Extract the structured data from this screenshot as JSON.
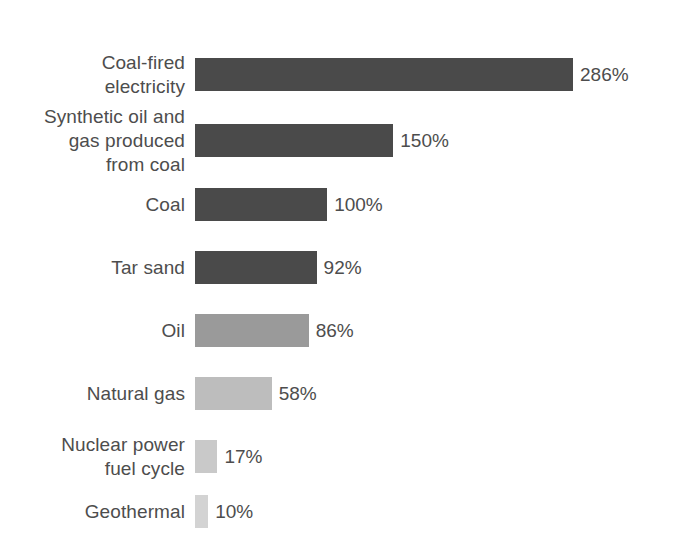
{
  "chart_data": {
    "type": "bar",
    "orientation": "horizontal",
    "title": "",
    "subtitle": "",
    "xlabel": "",
    "ylabel": "",
    "grid": false,
    "legend": null,
    "xlim": [
      0,
      286
    ],
    "value_suffix": "%",
    "categories": [
      "Coal-fired\nelectricity",
      "Synthetic oil and\ngas produced\nfrom coal",
      "Coal",
      "Tar sand",
      "Oil",
      "Natural gas",
      "Nuclear power\nfuel cycle",
      "Geothermal"
    ],
    "values": [
      286,
      150,
      100,
      92,
      86,
      58,
      17,
      10
    ],
    "value_labels": [
      "286%",
      "150%",
      "100%",
      "92%",
      "86%",
      "58%",
      "17%",
      "10%"
    ],
    "bar_colors": [
      "#4a4a4a",
      "#4a4a4a",
      "#4a4a4a",
      "#4a4a4a",
      "#9a9a9a",
      "#bdbdbd",
      "#c9c9c9",
      "#d3d3d3"
    ],
    "text_color": "#4d4d4d",
    "background_color": "#ffffff"
  },
  "bars": [
    {
      "label": "Coal-fired\nelectricity",
      "value_label": "286%",
      "value": 286,
      "color": "#4a4a4a",
      "top": 58
    },
    {
      "label": "Synthetic oil and\ngas produced\nfrom coal",
      "value_label": "150%",
      "value": 150,
      "color": "#4a4a4a",
      "top": 124
    },
    {
      "label": "Coal",
      "value_label": "100%",
      "value": 100,
      "color": "#4a4a4a",
      "top": 188
    },
    {
      "label": "Tar sand",
      "value_label": "92%",
      "value": 92,
      "color": "#4a4a4a",
      "top": 251
    },
    {
      "label": "Oil",
      "value_label": "86%",
      "value": 86,
      "color": "#9a9a9a",
      "top": 314
    },
    {
      "label": "Natural gas",
      "value_label": "58%",
      "value": 58,
      "color": "#bdbdbd",
      "top": 377
    },
    {
      "label": "Nuclear power\nfuel cycle",
      "value_label": "17%",
      "value": 17,
      "color": "#c9c9c9",
      "top": 440
    },
    {
      "label": "Geothermal",
      "value_label": "10%",
      "value": 10,
      "color": "#d3d3d3",
      "top": 495
    }
  ],
  "scale": {
    "px_per_unit": 1.3217,
    "bar_origin_x": 195,
    "bar_height": 33
  }
}
